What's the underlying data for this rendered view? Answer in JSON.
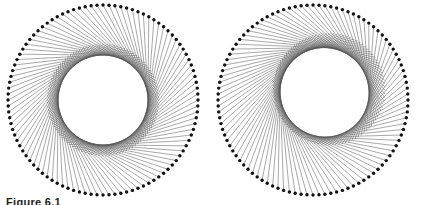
{
  "caption": "Figure 6.1",
  "diagrams": [
    {
      "name": "left",
      "dot_count": 100,
      "inner_ring": "concentric",
      "line_color": "#555555",
      "dot_color": "#111111"
    },
    {
      "name": "right",
      "dot_count": 100,
      "inner_ring": "offset upper-right",
      "line_color": "#555555",
      "dot_color": "#111111"
    }
  ]
}
